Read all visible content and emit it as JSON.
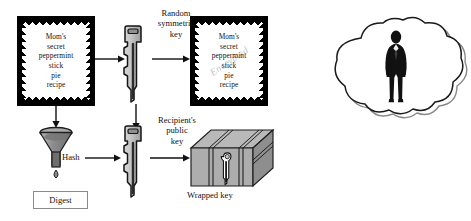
{
  "diagram": {
    "documents": [
      {
        "name": "plaintext-document",
        "lines": [
          "Mom's",
          "secret",
          "peppermint",
          "stick",
          "pie",
          "recipe"
        ],
        "watermark": ""
      },
      {
        "name": "encrypted-document",
        "lines": [
          "Mom's",
          "secret",
          "peppermint",
          "stick",
          "pie",
          "recipe"
        ],
        "watermark": "Encrypted"
      }
    ],
    "keys": [
      {
        "name": "symmetric-key",
        "label_lines": [
          "Random",
          "symmetric",
          "key"
        ]
      },
      {
        "name": "public-key",
        "label_lines": [
          "Recipient's",
          "public",
          "key"
        ]
      }
    ],
    "hash_label": "Hash",
    "digest_label": "Digest",
    "wrapped_key_label": "Wrapped key",
    "cloud": {
      "name": "recipient-cloud",
      "figure": "person-silhouette"
    },
    "colors": {
      "ink": "#111111",
      "document_border": "#000000",
      "key_fill": "#c0c0c0",
      "key_outline": "#1a1a1a",
      "box_fill": "#b5b5b5",
      "funnel_fill": "#9c9c9c",
      "paper": "#ffffff"
    }
  }
}
